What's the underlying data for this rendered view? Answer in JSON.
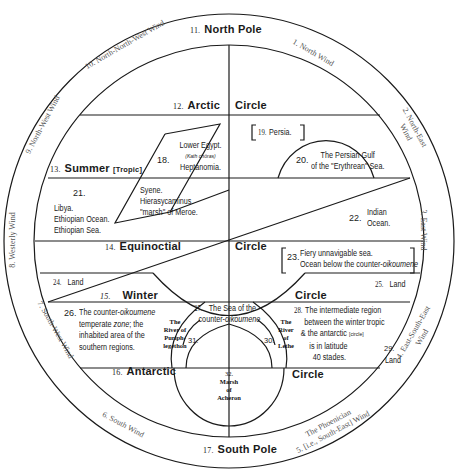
{
  "diagram": {
    "type": "world-zones-and-winds-diagram",
    "poles": {
      "north": {
        "num": "11.",
        "label": "North   Pole"
      },
      "south": {
        "num": "17.",
        "label": "South Pole"
      }
    },
    "circles": {
      "arctic": {
        "num": "12.",
        "left": "Arctic",
        "right": "Circle"
      },
      "summer": {
        "num": "13.",
        "left": "Summer",
        "tag": "[Tropic]"
      },
      "equinoctial": {
        "num": "14.",
        "left": "Equinoctial",
        "right": "Circle"
      },
      "winter": {
        "num": "15.",
        "left": "Winter",
        "right": "Circle"
      },
      "antarctic": {
        "num": "16.",
        "left": "Antarctic",
        "right": "Circle"
      }
    },
    "winds": [
      {
        "id": "1",
        "label": "1. North Wind"
      },
      {
        "id": "2",
        "label": "2. North-East Wind"
      },
      {
        "id": "3",
        "label": "3. East Wind"
      },
      {
        "id": "4",
        "label": "4. East-South-East Wind"
      },
      {
        "id": "5",
        "label_line1": "The Phoenician",
        "label_line2": "5. [i.e., South-East] Wind"
      },
      {
        "id": "6",
        "label": "6. South Wind"
      },
      {
        "id": "7",
        "label": "7. South-West Wind"
      },
      {
        "id": "8",
        "label": "8. Westerly Wind"
      },
      {
        "id": "9",
        "label": "9. North-West Wind"
      },
      {
        "id": "10",
        "label": "10. North-North-West Wind"
      }
    ],
    "regions": {
      "r18": {
        "num": "18.",
        "line1": "Lower Egypt.",
        "line2": "(Kath chōras)",
        "line3": "Heptanomia."
      },
      "r18b": {
        "line1": "Syene.",
        "line2": "Hierasycaminus.",
        "line3": "\"marsh\" of Meroe."
      },
      "r19": {
        "num": "19.",
        "label": "Persia."
      },
      "r20": {
        "num": "20.",
        "line1": "The Persian Gulf",
        "line2": "of the \"Erythrean\" Sea."
      },
      "r21": {
        "num": "21.",
        "line1": "Libya.",
        "line2": "Ethiopian Ocean.",
        "line3": "Ethiopian Sea."
      },
      "r22": {
        "num": "22.",
        "line1": "Indian",
        "line2": "Ocean."
      },
      "r23": {
        "num": "23.",
        "line1": "Fiery unnavigable sea.",
        "line2_pre": "Ocean below the counter-",
        "line2_ital": "oikoumene"
      },
      "r24": {
        "num": "24.",
        "label": "Land"
      },
      "r25": {
        "num": "25.",
        "label": "Land"
      },
      "r26": {
        "num": "26.",
        "line1_pre": "The counter-",
        "line1_ital": "oikoumene",
        "line2_pre": "temperate ",
        "line2_ital": "zone",
        "line2_post": "; the",
        "line3": "inhabited area of the",
        "line4": "southern regions."
      },
      "r27": {
        "num": "27.",
        "line1": "The Sea of the",
        "line2_pre": "counter-",
        "line2_ital": "oikoumene"
      },
      "r28": {
        "num": "28.",
        "line1": "The intermediate region",
        "line2": "between the winter tropic",
        "line3_pre": "& the antarctic ",
        "line3_small": "[circle]",
        "line4": "is in latitude",
        "line5": "40 stades."
      },
      "r29": {
        "num": "29.",
        "label": "Land"
      },
      "r30": {
        "num": "30.",
        "line1": "The",
        "line2": "River",
        "line3": "of",
        "line4": "Lethe"
      },
      "r31": {
        "num": "31.",
        "line1": "The",
        "line2": "River of",
        "line3": "Puriph-",
        "line4": "legethon"
      },
      "r32": {
        "num": "32.",
        "line1": "Marsh",
        "line2": "of",
        "line3": "Acheron"
      }
    },
    "colors": {
      "ink": "#1a1a1a",
      "wind_text": "#555555",
      "background": "#ffffff"
    }
  }
}
